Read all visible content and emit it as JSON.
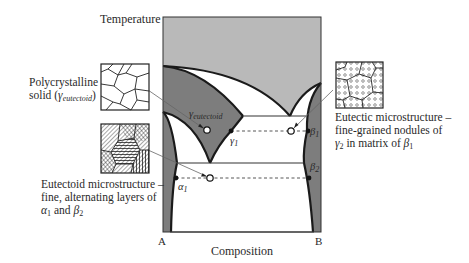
{
  "axes": {
    "y_label": "Temperature",
    "x_label": "Composition",
    "left_end": "A",
    "right_end": "B"
  },
  "phase_labels": {
    "gamma_eutectoid": {
      "symbol": "γ",
      "subscript": "eutectoid"
    },
    "gamma1": {
      "symbol": "γ",
      "subscript": "1"
    },
    "alpha1": {
      "symbol": "α",
      "subscript": "1"
    },
    "beta1": {
      "symbol": "β",
      "subscript": "1"
    },
    "beta2": {
      "symbol": "β",
      "subscript": "2"
    }
  },
  "callouts": {
    "polycrystalline": {
      "line1": "Polycrystalline",
      "line2_prefix": "solid (",
      "line2_symbol": "γ",
      "line2_sub": "eutectoid",
      "line2_suffix": ")"
    },
    "eutectic": {
      "line1": "Eutectic microstructure –",
      "line2": "fine-grained nodules of",
      "line3_sym1": "γ",
      "line3_sub1": "2",
      "line3_mid": " in matrix of ",
      "line3_sym2": "β",
      "line3_sub2": "1"
    },
    "eutectoid": {
      "line1": "Eutectoid microstructure –",
      "line2": "fine, alternating layers of",
      "line3_sym1": "α",
      "line3_sub1": "1",
      "line3_mid": " and ",
      "line3_sym2": "β",
      "line3_sub2": "2"
    }
  },
  "colors": {
    "liquid_region": "#b9b9b9",
    "solid_phase_dark": "#7d7d7d",
    "two_phase_white": "#ffffff",
    "lines": "#1a1a1a"
  }
}
